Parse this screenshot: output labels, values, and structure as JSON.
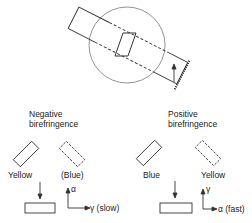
{
  "figure": {
    "top": {
      "description": "Compensator wedge in microscope field with crystal tube"
    },
    "negative": {
      "title_line1": "Negative",
      "title_line2": "birefringence",
      "left_label": "Yellow",
      "right_label": "(Blue)",
      "axis_vertical": "α",
      "axis_horizontal": "γ (slow)"
    },
    "positive": {
      "title_line1": "Positive",
      "title_line2": "birefringence",
      "left_label": "Blue",
      "right_label": "Yellow",
      "axis_vertical": "γ",
      "axis_horizontal": "α (fast)"
    },
    "colors": {
      "line": "#333333",
      "background": "#ffffff"
    }
  }
}
